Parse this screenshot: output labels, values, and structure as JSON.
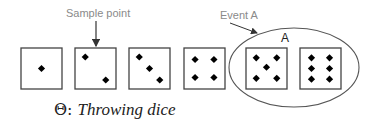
{
  "diagram": {
    "labels": {
      "sample_point": "Sample point",
      "event": "Event A",
      "event_set": "A"
    },
    "caption": {
      "symbol": "Θ: ",
      "text": "Throwing dice"
    },
    "dice": [
      {
        "face": 1,
        "pips": [
          [
            0.5,
            0.5
          ]
        ]
      },
      {
        "face": 2,
        "pips": [
          [
            0.25,
            0.22
          ],
          [
            0.75,
            0.78
          ]
        ]
      },
      {
        "face": 3,
        "pips": [
          [
            0.25,
            0.22
          ],
          [
            0.5,
            0.5
          ],
          [
            0.75,
            0.78
          ]
        ]
      },
      {
        "face": 4,
        "pips": [
          [
            0.27,
            0.28
          ],
          [
            0.73,
            0.28
          ],
          [
            0.27,
            0.72
          ],
          [
            0.73,
            0.72
          ]
        ]
      },
      {
        "face": 5,
        "pips": [
          [
            0.25,
            0.24
          ],
          [
            0.75,
            0.24
          ],
          [
            0.5,
            0.47
          ],
          [
            0.25,
            0.74
          ],
          [
            0.75,
            0.74
          ]
        ]
      },
      {
        "face": 6,
        "pips": [
          [
            0.28,
            0.24
          ],
          [
            0.72,
            0.24
          ],
          [
            0.28,
            0.5
          ],
          [
            0.72,
            0.5
          ],
          [
            0.28,
            0.76
          ],
          [
            0.72,
            0.76
          ]
        ]
      }
    ],
    "event_members": [
      5,
      6
    ],
    "colors": {
      "label_gray": "#8a8a8a",
      "outline": "#444444",
      "pip": "#000000"
    }
  }
}
